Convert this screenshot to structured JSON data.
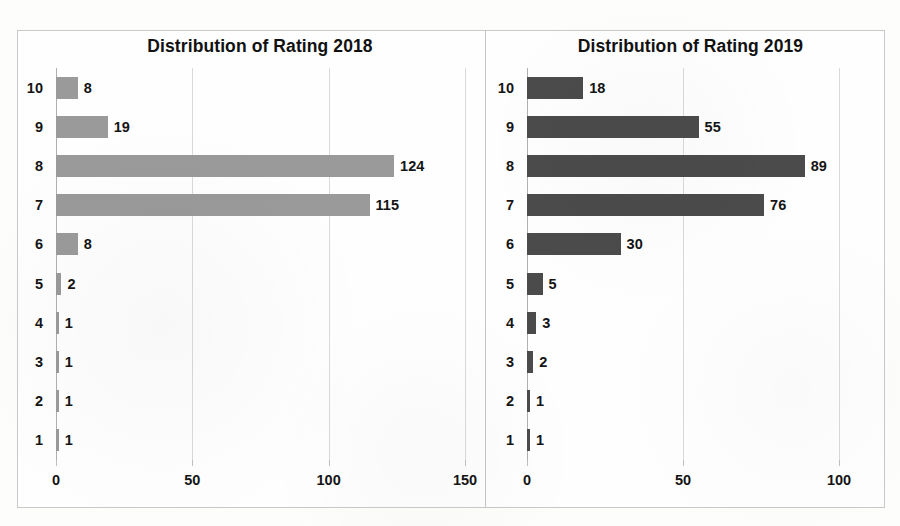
{
  "figure": {
    "background_color": "#fdfdfc",
    "frame_border_color": "#c9c9c9",
    "divider_color": "#c4c4c4"
  },
  "chart_data": [
    {
      "type": "bar",
      "orientation": "horizontal",
      "title": "Distribution of Rating 2018",
      "xlabel": "",
      "ylabel": "",
      "categories": [
        "10",
        "9",
        "8",
        "7",
        "6",
        "5",
        "4",
        "3",
        "2",
        "1"
      ],
      "values": [
        8,
        19,
        124,
        115,
        8,
        2,
        1,
        1,
        1,
        1
      ],
      "data_labels": [
        "8",
        "19",
        "124",
        "115",
        "8",
        "2",
        "1",
        "1",
        "1",
        "1"
      ],
      "xlim": [
        0,
        150
      ],
      "xticks": [
        0,
        50,
        100,
        150
      ],
      "xtick_labels": [
        "0",
        "50",
        "100",
        "150"
      ],
      "bar_color": "#9a9a9a",
      "grid": true,
      "grid_axis": "x",
      "legend": false
    },
    {
      "type": "bar",
      "orientation": "horizontal",
      "title": "Distribution of Rating 2019",
      "xlabel": "",
      "ylabel": "",
      "categories": [
        "10",
        "9",
        "8",
        "7",
        "6",
        "5",
        "4",
        "3",
        "2",
        "1"
      ],
      "values": [
        18,
        55,
        89,
        76,
        30,
        5,
        3,
        2,
        1,
        1
      ],
      "data_labels": [
        "18",
        "55",
        "89",
        "76",
        "30",
        "5",
        "3",
        "2",
        "1",
        "1"
      ],
      "xlim": [
        0,
        100
      ],
      "xticks": [
        0,
        50,
        100
      ],
      "xtick_labels": [
        "0",
        "50",
        "100"
      ],
      "bar_color": "#4b4b4b",
      "grid": true,
      "grid_axis": "x",
      "legend": false
    }
  ]
}
